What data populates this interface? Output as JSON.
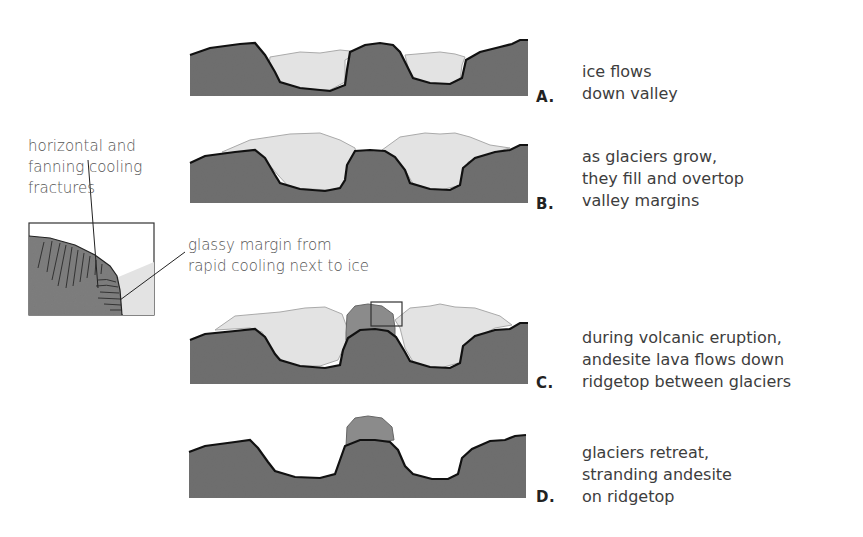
{
  "colors": {
    "bedrock": "#6f6f6f",
    "ice": "#e3e3e3",
    "ice_outline": "#a9a9a9",
    "andesite": "#8b8b8b",
    "outline": "#111111",
    "text": "#3d3d3d"
  },
  "panels": [
    {
      "letter": "A.",
      "caption": "ice flows\ndown valley"
    },
    {
      "letter": "B.",
      "caption": "as glaciers grow,\nthey fill and overtop\nvalley margins"
    },
    {
      "letter": "C.",
      "caption": "during volcanic eruption,\nandesite lava flows down\nridgetop between glaciers"
    },
    {
      "letter": "D.",
      "caption": "glaciers retreat,\nstranding andesite\non ridgetop"
    }
  ],
  "inset": {
    "label_fractures": "horizontal and\nfanning cooling\nfractures",
    "label_glassy": "glassy margin from\nrapid cooling next to ice"
  }
}
